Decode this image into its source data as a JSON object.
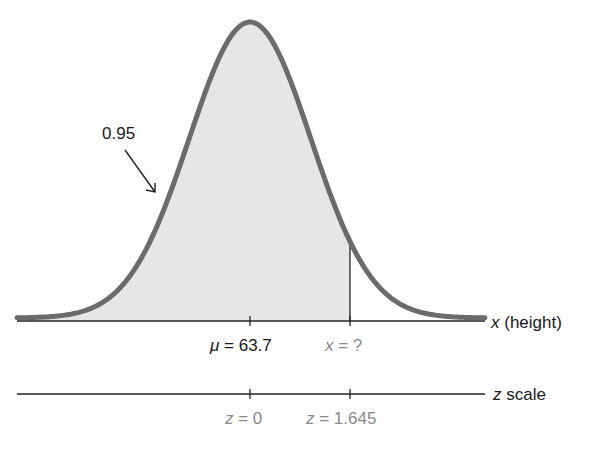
{
  "chart_data": {
    "type": "area",
    "title": "",
    "distribution": {
      "mean": 63.7,
      "z_cutoff": 1.645
    },
    "shaded_area": {
      "from": "-inf",
      "to": "x = ?",
      "area": 0.95,
      "label": "0.95"
    },
    "x_axis": {
      "label_var": "x",
      "label_rest": " (height)",
      "ticks": [
        {
          "position_z": 0,
          "label_var": "μ",
          "label_rest": " = 63.7"
        },
        {
          "position_z": 1.645,
          "label_var": "x",
          "label_rest": " = ?"
        }
      ]
    },
    "z_axis": {
      "label_var": "z",
      "label_rest": " scale",
      "ticks": [
        {
          "position_z": 0,
          "label_var": "z",
          "label_rest": " = 0"
        },
        {
          "position_z": 1.645,
          "label_var": "z",
          "label_rest": " = 1.645"
        }
      ]
    },
    "colors": {
      "curve": "#6b6b6b",
      "fill": "#e6e6e6",
      "axis": "#222222",
      "secondary_text": "#8a8a8a"
    }
  }
}
